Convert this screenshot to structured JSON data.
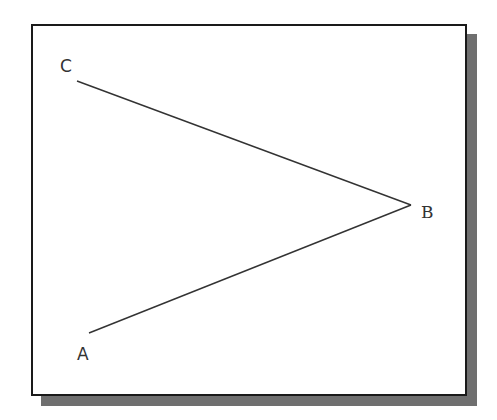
{
  "diagram": {
    "type": "angle",
    "points": {
      "A": {
        "label": "A",
        "line_end": [
          89,
          333
        ],
        "label_pos": [
          77,
          346
        ]
      },
      "B": {
        "label": "B",
        "vertex": [
          411,
          205
        ],
        "label_pos": [
          421,
          204
        ]
      },
      "C": {
        "label": "C",
        "line_end": [
          77,
          81
        ],
        "label_pos": [
          60,
          58
        ]
      }
    },
    "segments": [
      {
        "from": "C",
        "to": "B"
      },
      {
        "from": "B",
        "to": "A"
      }
    ],
    "colors": {
      "line": "#333333",
      "frame": "#1a1a1a",
      "shadow": "#6f6f6f",
      "background": "#ffffff"
    }
  }
}
